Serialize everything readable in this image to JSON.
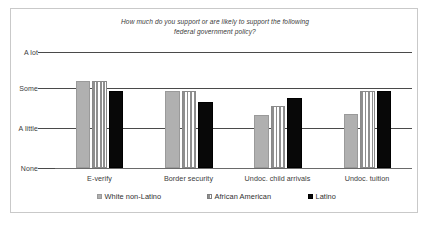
{
  "chart_data": {
    "type": "bar",
    "title": "How much do you support or are likely to support the following federal government policy?",
    "title_lines": [
      "How much do you support or are likely to support the following",
      "federal government policy?"
    ],
    "xlabel": "",
    "ylabel": "",
    "categories": [
      "E-verify",
      "Border security",
      "Undoc. child arrivals",
      "Undoc. tuition"
    ],
    "ytick_labels": [
      "A lot",
      "Some",
      "A little",
      "None"
    ],
    "ytick_values": [
      3,
      2,
      1,
      0
    ],
    "ylim": [
      0,
      3
    ],
    "grid": true,
    "legend_position": "bottom",
    "series": [
      {
        "name": "White non-Latino",
        "pattern": "solid-gray",
        "color": "#b0b0b0",
        "values": [
          2.25,
          2.0,
          1.37,
          1.4
        ]
      },
      {
        "name": "African American",
        "pattern": "cross-hatch",
        "color": "#8f8f8f",
        "values": [
          2.25,
          2.0,
          1.6,
          2.0
        ]
      },
      {
        "name": "Latino",
        "pattern": "solid-black",
        "color": "#080808",
        "values": [
          2.0,
          1.7,
          1.82,
          2.0
        ]
      }
    ]
  },
  "legend": {
    "items": [
      {
        "label": "White non-Latino",
        "swatch": "white-non-latino-swatch"
      },
      {
        "label": "African American",
        "swatch": "african-american-swatch"
      },
      {
        "label": "Latino",
        "swatch": "latino-swatch"
      }
    ]
  }
}
